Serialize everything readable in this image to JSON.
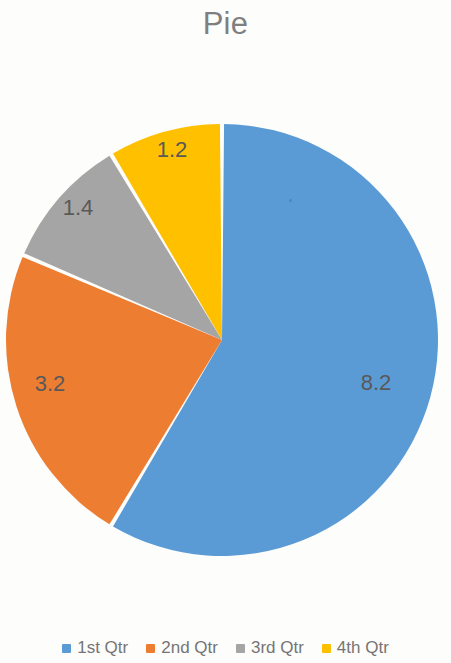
{
  "chart_data": {
    "type": "pie",
    "title": "Pie",
    "categories": [
      "1st Qtr",
      "2nd Qtr",
      "3rd Qtr",
      "4th Qtr"
    ],
    "values": [
      8.2,
      3.2,
      1.4,
      1.2
    ],
    "value_labels": [
      "8.2",
      "3.2",
      "1.4",
      "1.2"
    ],
    "colors": [
      "#5B9BD5",
      "#ED7D31",
      "#A5A5A5",
      "#FFC000"
    ],
    "total": 14.0,
    "start_angle_deg": 0,
    "direction": "clockwise",
    "legend_position": "bottom",
    "data_labels_shown": true,
    "slice_gap": true,
    "background_color": "#FDFDFC",
    "title_color": "#7F7F7F",
    "label_color": "#595959",
    "legend_text_color": "#757575"
  },
  "title": {
    "text": "Pie"
  },
  "slices": [
    {
      "label": "1st Qtr",
      "value_text": "8.2",
      "color": "#5B9BD5",
      "name": "pie-slice-1st-qtr"
    },
    {
      "label": "2nd Qtr",
      "value_text": "3.2",
      "color": "#ED7D31",
      "name": "pie-slice-2nd-qtr"
    },
    {
      "label": "3rd Qtr",
      "value_text": "1.4",
      "color": "#A5A5A5",
      "name": "pie-slice-3rd-qtr"
    },
    {
      "label": "4th Qtr",
      "value_text": "1.2",
      "color": "#FFC000",
      "name": "pie-slice-4th-qtr"
    }
  ],
  "legend": {
    "items": [
      {
        "label": "1st Qtr",
        "color": "#5B9BD5"
      },
      {
        "label": "2nd Qtr",
        "color": "#ED7D31"
      },
      {
        "label": "3rd Qtr",
        "color": "#A5A5A5"
      },
      {
        "label": "4th Qtr",
        "color": "#FFC000"
      }
    ]
  }
}
